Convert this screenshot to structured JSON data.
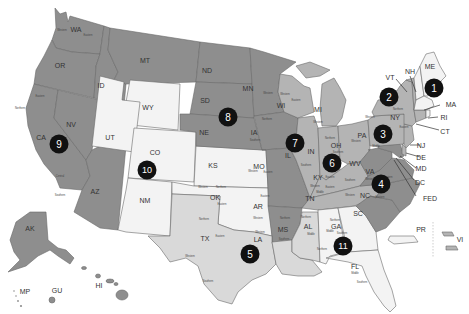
{
  "map": {
    "title": "U.S. Federal Court Circuits",
    "colors": {
      "dark": "#8e8e8e",
      "mid": "#b4b4b4",
      "light": "#d9d9d9",
      "white": "#f3f3f3",
      "border": "#6a6a6a",
      "badge": "#111111",
      "badge_text": "#ffffff"
    },
    "states": [
      {
        "abbr": "WA",
        "shade": "dark"
      },
      {
        "abbr": "OR",
        "shade": "dark"
      },
      {
        "abbr": "CA",
        "shade": "dark"
      },
      {
        "abbr": "NV",
        "shade": "dark"
      },
      {
        "abbr": "ID",
        "shade": "dark"
      },
      {
        "abbr": "MT",
        "shade": "dark"
      },
      {
        "abbr": "AZ",
        "shade": "dark"
      },
      {
        "abbr": "AK",
        "shade": "dark"
      },
      {
        "abbr": "HI",
        "shade": "dark"
      },
      {
        "abbr": "GU",
        "shade": "dark"
      },
      {
        "abbr": "MP",
        "shade": "dark"
      },
      {
        "abbr": "WY",
        "shade": "white"
      },
      {
        "abbr": "UT",
        "shade": "white"
      },
      {
        "abbr": "CO",
        "shade": "white"
      },
      {
        "abbr": "NM",
        "shade": "white"
      },
      {
        "abbr": "KS",
        "shade": "white"
      },
      {
        "abbr": "OK",
        "shade": "white"
      },
      {
        "abbr": "ND",
        "shade": "dark"
      },
      {
        "abbr": "SD",
        "shade": "dark"
      },
      {
        "abbr": "NE",
        "shade": "dark"
      },
      {
        "abbr": "MN",
        "shade": "dark"
      },
      {
        "abbr": "IA",
        "shade": "dark"
      },
      {
        "abbr": "MO",
        "shade": "dark"
      },
      {
        "abbr": "AR",
        "shade": "dark"
      },
      {
        "abbr": "TX",
        "shade": "light"
      },
      {
        "abbr": "LA",
        "shade": "light"
      },
      {
        "abbr": "MS",
        "shade": "light"
      },
      {
        "abbr": "WI",
        "shade": "mid"
      },
      {
        "abbr": "IL",
        "shade": "mid"
      },
      {
        "abbr": "IN",
        "shade": "mid"
      },
      {
        "abbr": "MI",
        "shade": "mid"
      },
      {
        "abbr": "OH",
        "shade": "mid"
      },
      {
        "abbr": "KY",
        "shade": "mid"
      },
      {
        "abbr": "TN",
        "shade": "mid"
      },
      {
        "abbr": "AL",
        "shade": "white"
      },
      {
        "abbr": "GA",
        "shade": "white"
      },
      {
        "abbr": "FL",
        "shade": "white"
      },
      {
        "abbr": "SC",
        "shade": "dark"
      },
      {
        "abbr": "NC",
        "shade": "dark"
      },
      {
        "abbr": "VA",
        "shade": "dark"
      },
      {
        "abbr": "WV",
        "shade": "dark"
      },
      {
        "abbr": "MD",
        "shade": "dark"
      },
      {
        "abbr": "PA",
        "shade": "mid"
      },
      {
        "abbr": "NY",
        "shade": "mid"
      },
      {
        "abbr": "NJ",
        "shade": "mid"
      },
      {
        "abbr": "DE",
        "shade": "mid"
      },
      {
        "abbr": "VT",
        "shade": "mid"
      },
      {
        "abbr": "CT",
        "shade": "mid"
      },
      {
        "abbr": "NH",
        "shade": "white"
      },
      {
        "abbr": "ME",
        "shade": "white"
      },
      {
        "abbr": "MA",
        "shade": "white"
      },
      {
        "abbr": "RI",
        "shade": "white"
      },
      {
        "abbr": "PR",
        "shade": "white"
      },
      {
        "abbr": "VI",
        "shade": "mid"
      }
    ],
    "labels": {
      "WA": "WA",
      "OR": "OR",
      "CA": "CA",
      "NV": "NV",
      "ID": "ID",
      "MT": "MT",
      "AZ": "AZ",
      "AK": "AK",
      "HI": "HI",
      "GU": "GU",
      "MP": "MP",
      "WY": "WY",
      "UT": "UT",
      "CO": "CO",
      "NM": "NM",
      "KS": "KS",
      "OK": "OK",
      "ND": "ND",
      "SD": "SD",
      "NE": "NE",
      "MN": "MN",
      "IA": "IA",
      "MO": "MO",
      "AR": "AR",
      "TX": "TX",
      "LA": "LA",
      "MS": "MS",
      "WI": "WI",
      "IL": "IL",
      "IN": "IN",
      "MI": "MI",
      "OH": "OH",
      "KY": "KY",
      "TN": "TN",
      "AL": "AL",
      "GA": "GA",
      "FL": "FL",
      "SC": "SC",
      "NC": "NC",
      "VA": "VA",
      "WV": "WV",
      "PA": "PA",
      "NY": "NY",
      "VT": "VT",
      "NH": "NH",
      "ME": "ME",
      "PR": "PR",
      "VI": "VI"
    },
    "callouts": [
      {
        "label": "VT"
      },
      {
        "label": "NH"
      },
      {
        "label": "MA"
      },
      {
        "label": "RI"
      },
      {
        "label": "CT"
      },
      {
        "label": "NJ"
      },
      {
        "label": "DE"
      },
      {
        "label": "MD"
      },
      {
        "label": "DC"
      },
      {
        "label": "FED"
      }
    ],
    "district_labels": {
      "western": "Western",
      "eastern": "Eastern",
      "northern": "Northern",
      "southern": "Southern",
      "central": "Central",
      "middle": "Middle"
    },
    "circuits": [
      {
        "number": "1"
      },
      {
        "number": "2"
      },
      {
        "number": "3"
      },
      {
        "number": "4"
      },
      {
        "number": "5"
      },
      {
        "number": "6"
      },
      {
        "number": "7"
      },
      {
        "number": "8"
      },
      {
        "number": "9"
      },
      {
        "number": "10"
      },
      {
        "number": "11"
      }
    ]
  }
}
